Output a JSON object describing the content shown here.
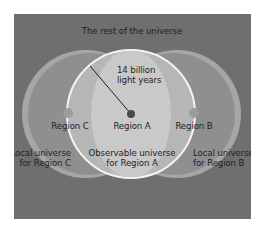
{
  "diagram": {
    "title": "The rest of the universe",
    "radius_label_line1": "14 billion",
    "radius_label_line2": "light years",
    "regions": {
      "a": {
        "label": "Region A",
        "caption_line1": "Observable universe",
        "caption_line2": "for Region A"
      },
      "b": {
        "label": "Region B",
        "caption_line1": "Local universe",
        "caption_line2": "for Region B"
      },
      "c": {
        "label": "Region C",
        "caption_line1": "Local universe",
        "caption_line2": "for Region C"
      }
    },
    "colors": {
      "background": "#6f6f6f",
      "side_lobes": "#8f8f8f",
      "side_lobe_rim": "#a8a8a8",
      "observable": "#b9b9b9",
      "observable_outline": "#f4f4f4",
      "center_dot": "#4a4a4a",
      "edge_dots": "#9c9c9c",
      "text": "#1f1f1f"
    }
  }
}
